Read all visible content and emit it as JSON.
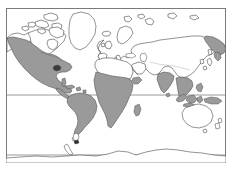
{
  "figure": {
    "type": "world-map",
    "title": "World distribution map",
    "projection": "equirectangular",
    "width": 232,
    "height": 172,
    "background_color": "#ffffff"
  },
  "frame": {
    "x": 6,
    "y": 8,
    "width": 220,
    "height": 155,
    "stroke_color": "#7a7a7a",
    "stroke_width": 1,
    "fill_color": "#ffffff"
  },
  "gridlines": [
    {
      "name": "latitude-line-upper",
      "orientation": "horizontal",
      "y": 95,
      "stroke_color": "#8c8c8c"
    },
    {
      "name": "latitude-line-lower",
      "orientation": "horizontal",
      "y": 155,
      "stroke_color": "#8c8c8c"
    }
  ],
  "styles": {
    "coastline_color": "#4a4a4a",
    "coastline_width": 0.6,
    "land_fill": "#ffffff",
    "shaded_fill": "#9a9a9a",
    "shaded_stroke": "#555555"
  },
  "legend": {
    "visible": false,
    "shaded_meaning": "distribution range",
    "unshaded_meaning": "outside range"
  },
  "regions": [
    {
      "name": "north-america",
      "shaded": true,
      "shaded_portion": "western and southern"
    },
    {
      "name": "greenland",
      "shaded": false
    },
    {
      "name": "canadian-arctic-archipelago",
      "shaded": false
    },
    {
      "name": "central-america",
      "shaded": true
    },
    {
      "name": "caribbean",
      "shaded": true
    },
    {
      "name": "south-america",
      "shaded": true,
      "shaded_portion": "all except southern tip"
    },
    {
      "name": "europe",
      "shaded": false
    },
    {
      "name": "north-africa",
      "shaded": false
    },
    {
      "name": "sub-saharan-africa",
      "shaded": true
    },
    {
      "name": "madagascar",
      "shaded": true
    },
    {
      "name": "middle-east",
      "shaded": false
    },
    {
      "name": "india",
      "shaded": true
    },
    {
      "name": "southeast-asia",
      "shaded": true
    },
    {
      "name": "indonesia",
      "shaded": true
    },
    {
      "name": "northern-asia",
      "shaded": false
    },
    {
      "name": "eastern-siberia-coast",
      "shaded": true
    },
    {
      "name": "japan",
      "shaded": false
    },
    {
      "name": "australia",
      "shaded": false
    },
    {
      "name": "new-zealand",
      "shaded": false
    },
    {
      "name": "antarctica",
      "shaded": false
    }
  ]
}
